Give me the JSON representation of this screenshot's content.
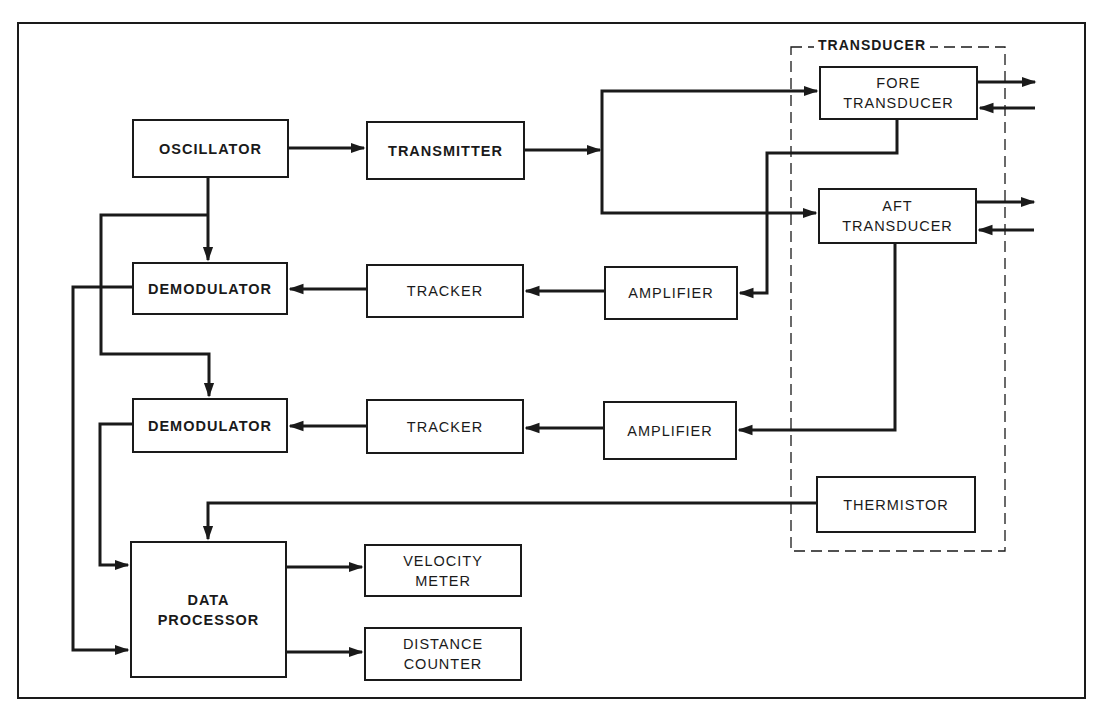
{
  "diagram": {
    "title": "",
    "group": {
      "label": "TRANSDUCER"
    },
    "blocks": {
      "oscillator": {
        "lines": [
          "OSCILLATOR"
        ]
      },
      "transmitter": {
        "lines": [
          "TRANSMITTER"
        ]
      },
      "fore_transducer": {
        "lines": [
          "FORE",
          "TRANSDUCER"
        ]
      },
      "aft_transducer": {
        "lines": [
          "AFT",
          "TRANSDUCER"
        ]
      },
      "demodulator_1": {
        "lines": [
          "DEMODULATOR"
        ]
      },
      "tracker_1": {
        "lines": [
          "TRACKER"
        ]
      },
      "amplifier_1": {
        "lines": [
          "AMPLIFIER"
        ]
      },
      "demodulator_2": {
        "lines": [
          "DEMODULATOR"
        ]
      },
      "tracker_2": {
        "lines": [
          "TRACKER"
        ]
      },
      "amplifier_2": {
        "lines": [
          "AMPLIFIER"
        ]
      },
      "thermistor": {
        "lines": [
          "THERMISTOR"
        ]
      },
      "data_processor": {
        "lines": [
          "DATA",
          "PROCESSOR"
        ]
      },
      "velocity_meter": {
        "lines": [
          "VELOCITY",
          "METER"
        ]
      },
      "distance_counter": {
        "lines": [
          "DISTANCE",
          "COUNTER"
        ]
      }
    },
    "connections": [
      {
        "from": "OSCILLATOR",
        "to": "TRANSMITTER"
      },
      {
        "from": "TRANSMITTER",
        "to": "FORE TRANSDUCER"
      },
      {
        "from": "TRANSMITTER",
        "to": "AFT TRANSDUCER"
      },
      {
        "from": "FORE TRANSDUCER",
        "to": "AMPLIFIER (upper)"
      },
      {
        "from": "AFT TRANSDUCER",
        "to": "AMPLIFIER (lower)"
      },
      {
        "from": "AMPLIFIER (upper)",
        "to": "TRACKER (upper)"
      },
      {
        "from": "TRACKER (upper)",
        "to": "DEMODULATOR (upper)"
      },
      {
        "from": "AMPLIFIER (lower)",
        "to": "TRACKER (lower)"
      },
      {
        "from": "TRACKER (lower)",
        "to": "DEMODULATOR (lower)"
      },
      {
        "from": "OSCILLATOR",
        "to": "DEMODULATOR (upper)"
      },
      {
        "from": "OSCILLATOR",
        "to": "DEMODULATOR (lower)"
      },
      {
        "from": "DEMODULATOR (upper)",
        "to": "DATA PROCESSOR"
      },
      {
        "from": "DEMODULATOR (lower)",
        "to": "DATA PROCESSOR"
      },
      {
        "from": "THERMISTOR",
        "to": "DATA PROCESSOR"
      },
      {
        "from": "DATA PROCESSOR",
        "to": "VELOCITY METER"
      },
      {
        "from": "DATA PROCESSOR",
        "to": "DISTANCE COUNTER"
      }
    ],
    "colors": {
      "ink": "#1a1a1a",
      "background": "#ffffff"
    }
  }
}
